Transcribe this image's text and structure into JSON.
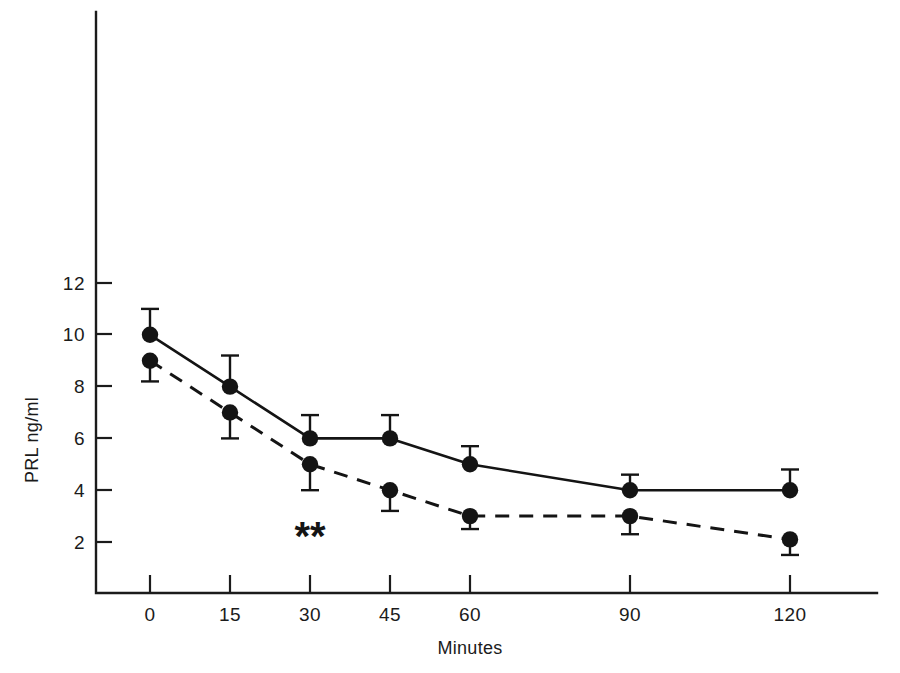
{
  "chart_data": {
    "type": "line",
    "title": "",
    "xlabel": "Minutes",
    "ylabel": "PRL ng/ml",
    "x": [
      0,
      15,
      30,
      45,
      60,
      90,
      120
    ],
    "xtick_labels": [
      "0",
      "15",
      "30",
      "45",
      "60",
      "90",
      "120"
    ],
    "ytick_labels": [
      "2",
      "4",
      "6",
      "8",
      "10",
      "12"
    ],
    "yticks": [
      2,
      4,
      6,
      8,
      10,
      12
    ],
    "ylim": [
      0,
      13
    ],
    "xlim": [
      -7,
      136
    ],
    "grid": false,
    "legend": "none",
    "series": [
      {
        "name": "solid-line-series",
        "style": "solid",
        "marker": "filled-circle",
        "error_direction": "up",
        "values": [
          10,
          8,
          6,
          6,
          5,
          4,
          4
        ],
        "errors": [
          1.0,
          1.2,
          0.9,
          0.9,
          0.7,
          0.6,
          0.8
        ]
      },
      {
        "name": "dashed-line-series",
        "style": "dashed",
        "marker": "filled-circle",
        "error_direction": "down",
        "values": [
          9,
          7,
          5,
          4,
          3,
          3,
          2.1
        ],
        "errors": [
          0.8,
          1.0,
          1.0,
          0.8,
          0.5,
          0.7,
          0.6
        ]
      }
    ],
    "annotations": [
      {
        "name": "significance-asterisks",
        "text": "**",
        "x": 30,
        "y": 1.7
      }
    ]
  },
  "axes": {
    "y_title": "PRL ng/ml",
    "x_title": "Minutes"
  },
  "caption": {
    "partial_text": ""
  }
}
